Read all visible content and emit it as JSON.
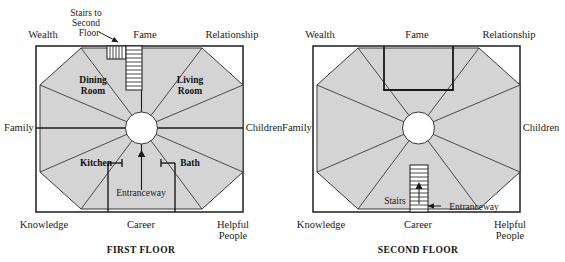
{
  "diagram": {
    "colors": {
      "octagon_fill": "#d4d4d4",
      "stroke": "#2b2b2b",
      "background": "#ffffff",
      "center_circle_fill": "#ffffff"
    },
    "floors": [
      {
        "id": "first-floor",
        "title": "FIRST FLOOR",
        "bagua_labels": {
          "top_left": "Wealth",
          "top_center": "Fame",
          "top_right": "Relationship",
          "mid_left": "Family",
          "mid_right": "Children",
          "bottom_left": "Knowledge",
          "bottom_center": "Career",
          "bottom_right_line1": "Helpful",
          "bottom_right_line2": "People"
        },
        "rooms": [
          {
            "name": "Dining Room",
            "line1": "Dining",
            "line2": "Room"
          },
          {
            "name": "Living Room",
            "line1": "Living",
            "line2": "Room"
          },
          {
            "name": "Kitchen",
            "line1": "Kitchen",
            "line2": ""
          },
          {
            "name": "Bath",
            "line1": "Bath",
            "line2": ""
          }
        ],
        "annotations": [
          {
            "id": "stairs-callout",
            "line1": "Stairs to",
            "line2": "Second",
            "line3": "Floor"
          },
          {
            "id": "entranceway",
            "text": "Entranceway"
          }
        ]
      },
      {
        "id": "second-floor",
        "title": "SECOND FLOOR",
        "bagua_labels": {
          "top_left": "Wealth",
          "top_center": "Fame",
          "top_right": "Relationship",
          "mid_left": "Family",
          "mid_right": "Children",
          "bottom_left": "Knowledge",
          "bottom_center": "Career",
          "bottom_right_line1": "Helpful",
          "bottom_right_line2": "People"
        },
        "rooms": [],
        "annotations": [
          {
            "id": "stairs",
            "text": "Stairs"
          },
          {
            "id": "entranceway",
            "text": "Entranceway"
          }
        ]
      }
    ]
  }
}
